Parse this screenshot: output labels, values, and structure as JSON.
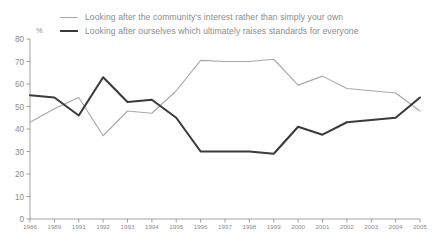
{
  "chart_data": {
    "type": "line",
    "title": "",
    "xlabel": "",
    "ylabel": "%",
    "ylim": [
      0,
      80
    ],
    "ytick_step": 10,
    "yticks": [
      0,
      10,
      20,
      30,
      40,
      50,
      60,
      70,
      80
    ],
    "grid": false,
    "legend_position": "top",
    "categories": [
      "1986",
      "1989",
      "1991",
      "1992",
      "1993",
      "1994",
      "1995",
      "1996",
      "1997",
      "1998",
      "1999",
      "2000",
      "2001",
      "2002",
      "2003",
      "2004",
      "2005"
    ],
    "series": [
      {
        "name": "Looking after the community's interest rather than simply your own",
        "color": "#a8a8a8",
        "style": "thin",
        "values": [
          43,
          49,
          54,
          37,
          48,
          47,
          57,
          70.5,
          70,
          70,
          71,
          59.5,
          63.5,
          58,
          57,
          56,
          48
        ]
      },
      {
        "name": "Looking after ourselves which ultimately raises standards for everyone",
        "color": "#3b3b3b",
        "style": "thick",
        "values": [
          55,
          54,
          46,
          63,
          52,
          53,
          45,
          30,
          30,
          30,
          29,
          41,
          37.5,
          43,
          44,
          45,
          54
        ]
      }
    ]
  },
  "legend": {
    "items": [
      {
        "label": "Looking after the community's interest rather than simply your own",
        "swatch": "light"
      },
      {
        "label": "Looking after ourselves which ultimately raises standards for everyone",
        "swatch": "dark"
      }
    ]
  },
  "axis": {
    "unit_label": "%",
    "y_tick_labels": [
      "80",
      "70",
      "60",
      "50",
      "40",
      "30",
      "20",
      "10",
      "0"
    ],
    "x_tick_labels": [
      "1986",
      "1989",
      "1991",
      "1992",
      "1993",
      "1994",
      "1995",
      "1996",
      "1997",
      "1998",
      "1999",
      "2000",
      "2001",
      "2002",
      "2003",
      "2004",
      "2005"
    ]
  },
  "colors": {
    "light_series": "#a8a8a8",
    "dark_series": "#3b3b3b",
    "axis": "#8c8c8c",
    "text": "#8c8c8c",
    "background": "#ffffff"
  }
}
